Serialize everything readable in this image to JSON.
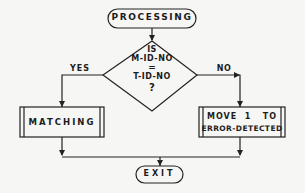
{
  "diagram": {
    "type": "flowchart",
    "nodes": {
      "start": {
        "shape": "terminal",
        "label": "PROCESSING"
      },
      "decision": {
        "shape": "diamond",
        "lines": [
          "IS",
          "M-ID-NO",
          "=",
          "T-ID-NO",
          "?"
        ]
      },
      "yes_process": {
        "shape": "predefined-process",
        "label": "MATCHING"
      },
      "no_process": {
        "shape": "predefined-process",
        "lines": [
          "MOVE  1   TO",
          "ERROR-DETECTED"
        ]
      },
      "end": {
        "shape": "terminal",
        "label": "EXIT"
      }
    },
    "edges": [
      {
        "from": "start",
        "to": "decision",
        "label": ""
      },
      {
        "from": "decision",
        "to": "yes_process",
        "label": "YES"
      },
      {
        "from": "decision",
        "to": "no_process",
        "label": "NO"
      },
      {
        "from": "yes_process",
        "to": "end",
        "label": ""
      },
      {
        "from": "no_process",
        "to": "end",
        "label": ""
      }
    ],
    "colors": {
      "line": "#222222",
      "background": "#f6f6f4"
    }
  }
}
